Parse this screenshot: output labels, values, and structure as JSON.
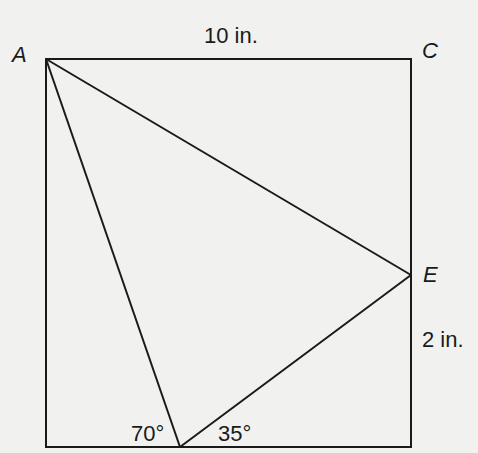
{
  "diagram": {
    "background": "#f1f1ef",
    "stroke_color": "#1a1a1a",
    "points": {
      "A": {
        "label": "A"
      },
      "C": {
        "label": "C"
      },
      "E": {
        "label": "E"
      }
    },
    "measurements": {
      "top_side": "10 in.",
      "right_segment": "2 in."
    },
    "angles": {
      "left_angle": "70°",
      "right_angle": "35°"
    },
    "shapes": {
      "rectangle": {
        "x1": 46,
        "y1": 59,
        "x2": 411,
        "y2": 447
      },
      "vertex_A": [
        46,
        59
      ],
      "vertex_C": [
        411,
        59
      ],
      "vertex_E": [
        411,
        275
      ],
      "vertex_bottom": [
        180,
        447
      ]
    }
  }
}
